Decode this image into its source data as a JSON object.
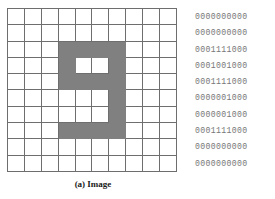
{
  "figure": {
    "panels": [
      {
        "id": "image",
        "caption": "(a) Image",
        "grid": {
          "rows": 10,
          "cols": 10,
          "on_color": "#808080",
          "off_color": "#ffffff",
          "line_color": "#6e6e6e",
          "cells": [
            [
              0,
              0,
              0,
              0,
              0,
              0,
              0,
              0,
              0,
              0
            ],
            [
              0,
              0,
              0,
              0,
              0,
              0,
              0,
              0,
              0,
              0
            ],
            [
              0,
              0,
              0,
              1,
              1,
              1,
              1,
              0,
              0,
              0
            ],
            [
              0,
              0,
              0,
              1,
              0,
              0,
              1,
              0,
              0,
              0
            ],
            [
              0,
              0,
              0,
              1,
              1,
              1,
              1,
              0,
              0,
              0
            ],
            [
              0,
              0,
              0,
              0,
              0,
              0,
              1,
              0,
              0,
              0
            ],
            [
              0,
              0,
              0,
              0,
              0,
              0,
              1,
              0,
              0,
              0
            ],
            [
              0,
              0,
              0,
              1,
              1,
              1,
              1,
              0,
              0,
              0
            ],
            [
              0,
              0,
              0,
              0,
              0,
              0,
              0,
              0,
              0,
              0
            ],
            [
              0,
              0,
              0,
              0,
              0,
              0,
              0,
              0,
              0,
              0
            ]
          ]
        }
      },
      {
        "id": "binary-code",
        "caption": "(b) Binary code",
        "text_color": "#777777",
        "rows": [
          "0000000000",
          "0000000000",
          "0001111000",
          "0001001000",
          "0001111000",
          "0000001000",
          "0000001000",
          "0001111000",
          "0000000000",
          "0000000000"
        ]
      }
    ]
  }
}
